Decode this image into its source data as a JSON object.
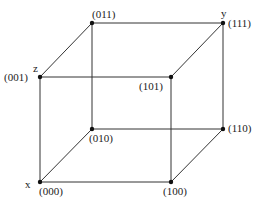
{
  "diagram": {
    "type": "binary-cube",
    "line_color": "#333333",
    "vertex_color": "#111111",
    "vertices": [
      {
        "id": "000",
        "label": "(000)",
        "x": 40,
        "y": 182,
        "lx": 39,
        "ly": 186
      },
      {
        "id": "100",
        "label": "(100)",
        "x": 171,
        "y": 182,
        "lx": 163,
        "ly": 186
      },
      {
        "id": "010",
        "label": "(010)",
        "x": 92,
        "y": 129,
        "lx": 89,
        "ly": 133
      },
      {
        "id": "110",
        "label": "(110)",
        "x": 223,
        "y": 129,
        "lx": 228,
        "ly": 123
      },
      {
        "id": "001",
        "label": "(001)",
        "x": 40,
        "y": 77,
        "lx": 4,
        "ly": 72
      },
      {
        "id": "101",
        "label": "(101)",
        "x": 171,
        "y": 77,
        "lx": 139,
        "ly": 81
      },
      {
        "id": "011",
        "label": "(011)",
        "x": 92,
        "y": 23,
        "lx": 92,
        "ly": 9
      },
      {
        "id": "111",
        "label": "(111)",
        "x": 223,
        "y": 23,
        "lx": 228,
        "ly": 18
      }
    ],
    "edges": [
      [
        "000",
        "100"
      ],
      [
        "000",
        "010"
      ],
      [
        "000",
        "001"
      ],
      [
        "100",
        "110"
      ],
      [
        "100",
        "101"
      ],
      [
        "010",
        "110"
      ],
      [
        "010",
        "011"
      ],
      [
        "110",
        "111"
      ],
      [
        "001",
        "101"
      ],
      [
        "001",
        "011"
      ],
      [
        "101",
        "111"
      ],
      [
        "011",
        "111"
      ]
    ],
    "axis_labels": [
      {
        "text": "x",
        "x": 25,
        "y": 179
      },
      {
        "text": "y",
        "x": 221,
        "y": 8
      },
      {
        "text": "z",
        "x": 33,
        "y": 63
      }
    ]
  }
}
